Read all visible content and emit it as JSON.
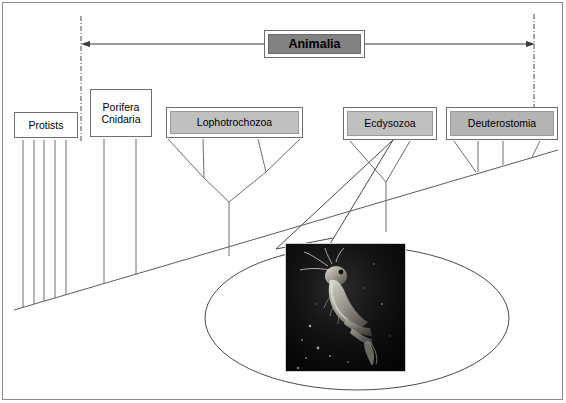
{
  "diagram": {
    "title_box": {
      "label": "Animalia",
      "style": "dark-filled",
      "x": 264,
      "y": 30,
      "w": 101,
      "h": 28
    },
    "range_arrow": {
      "description": "double-headed horizontal arrow spanning the Animalia clade",
      "left_x": 82,
      "right_x": 534,
      "y": 44
    },
    "boundary_lines": [
      {
        "name": "left-clade-boundary",
        "x": 81,
        "y1": 16,
        "y2": 141,
        "style": "dash-dot"
      },
      {
        "name": "right-clade-boundary",
        "x": 534,
        "y1": 14,
        "y2": 112,
        "style": "dash-dot"
      }
    ],
    "taxa": [
      {
        "id": "protists",
        "label": "Protists",
        "style": "plain",
        "x": 14,
        "y": 112,
        "w": 64,
        "h": 26,
        "tips": 5
      },
      {
        "id": "porifera",
        "label": "Porifera\nCnidaria",
        "style": "plain",
        "x": 90,
        "y": 89,
        "w": 62,
        "h": 48,
        "tips": 2
      },
      {
        "id": "lophotrochozoa",
        "label": "Lophotrochozoa",
        "style": "light-filled",
        "x": 166,
        "y": 107,
        "w": 137,
        "h": 31,
        "tips": 4
      },
      {
        "id": "ecdysozoa",
        "label": "Ecdysozoa",
        "style": "light-filled",
        "x": 343,
        "y": 107,
        "w": 94,
        "h": 33,
        "tips": 2
      },
      {
        "id": "deuterostomia",
        "label": "Deuterostomia",
        "style": "mid-filled",
        "x": 446,
        "y": 107,
        "w": 112,
        "h": 33,
        "tips": 4
      }
    ],
    "baseline": {
      "name": "time-baseline",
      "from": [
        14,
        310
      ],
      "to": [
        558,
        150
      ]
    },
    "callout": {
      "name": "shrimp-callout-ellipse",
      "cx": 357,
      "cy": 318,
      "rx": 152,
      "ry": 72,
      "leader_from": "ecdysozoa",
      "photo": {
        "name": "krill-photograph",
        "subject": "krill / shrimp-like crustacean on dark background",
        "x": 285,
        "y": 243,
        "w": 121,
        "h": 129
      }
    },
    "colors": {
      "animalia_fill": "#818181",
      "lophotrochozoa_fill": "#c0c0c0",
      "ecdysozoa_fill": "#c0c0c0",
      "deuterostomia_fill": "#b4b4b4",
      "line": "#555555",
      "border": "#707070",
      "page_border": "#8c8c8c"
    }
  }
}
